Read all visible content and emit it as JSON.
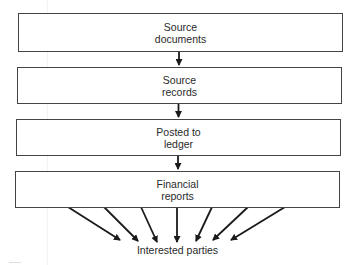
{
  "diagram": {
    "type": "flowchart",
    "direction": "top-to-bottom",
    "nodes": [
      {
        "id": "source-documents",
        "line1": "Source",
        "line2": "documents"
      },
      {
        "id": "source-records",
        "line1": "Source",
        "line2": "records"
      },
      {
        "id": "posted-to-ledger",
        "line1": "Posted to",
        "line2": "ledger"
      },
      {
        "id": "financial-reports",
        "line1": "Financial",
        "line2": "reports"
      }
    ],
    "edges": [
      {
        "from": "source-documents",
        "to": "source-records"
      },
      {
        "from": "source-records",
        "to": "posted-to-ledger"
      },
      {
        "from": "posted-to-ledger",
        "to": "financial-reports"
      },
      {
        "from": "financial-reports",
        "to": "interested-parties",
        "count": 7
      }
    ],
    "target": {
      "id": "interested-parties",
      "label": "Interested parties"
    },
    "colors": {
      "stroke": "#444444",
      "arrow": "#1a1a1a",
      "text": "#2a2a2a",
      "background": "#ffffff"
    }
  }
}
